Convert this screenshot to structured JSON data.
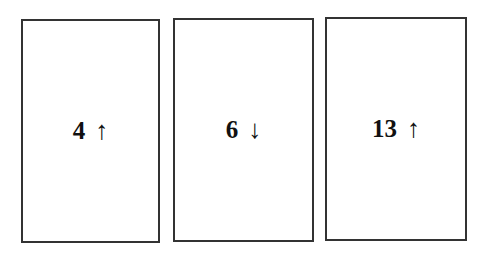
{
  "cards": [
    {
      "value": "4",
      "arrow": "↑",
      "direction": "up"
    },
    {
      "value": "6",
      "arrow": "↓",
      "direction": "down"
    },
    {
      "value": "13",
      "arrow": "↑",
      "direction": "up"
    }
  ]
}
